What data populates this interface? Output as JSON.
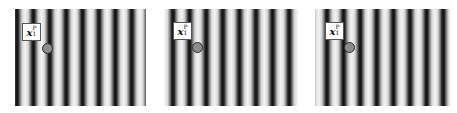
{
  "figure": {
    "panels": [
      {
        "id": "panel-1",
        "x": 15,
        "width": 131,
        "grating": {
          "orientation": "vertical",
          "period_px": 16.4,
          "phase_px": 2,
          "stripe_count": 8
        },
        "label": {
          "symbol": "x",
          "subscript": "1",
          "superscript": "P",
          "x": 7,
          "y": 14
        },
        "marker": {
          "cx": 32,
          "cy": 39,
          "fill": "#8c8c8c",
          "stroke": "#2a2a2a"
        }
      },
      {
        "id": "panel-2",
        "x": 164,
        "width": 134,
        "grating": {
          "orientation": "vertical",
          "period_px": 16.6,
          "phase_px": 9,
          "stripe_count": 8
        },
        "label": {
          "symbol": "x",
          "subscript": "1",
          "superscript": "P",
          "x": 9,
          "y": 13
        },
        "marker": {
          "cx": 33,
          "cy": 38,
          "fill": "#8c8c8c",
          "stroke": "#2a2a2a"
        }
      },
      {
        "id": "panel-3",
        "x": 315,
        "width": 135,
        "grating": {
          "orientation": "vertical",
          "period_px": 16.6,
          "phase_px": 12,
          "stripe_count": 8
        },
        "label": {
          "symbol": "x",
          "subscript": "1",
          "superscript": "P",
          "x": 10,
          "y": 13
        },
        "marker": {
          "cx": 34,
          "cy": 38,
          "fill": "#8c8c8c",
          "stroke": "#2a2a2a"
        }
      }
    ],
    "colors": {
      "dark": "#111111",
      "light": "#f4f4f4",
      "background": "#ffffff"
    }
  }
}
